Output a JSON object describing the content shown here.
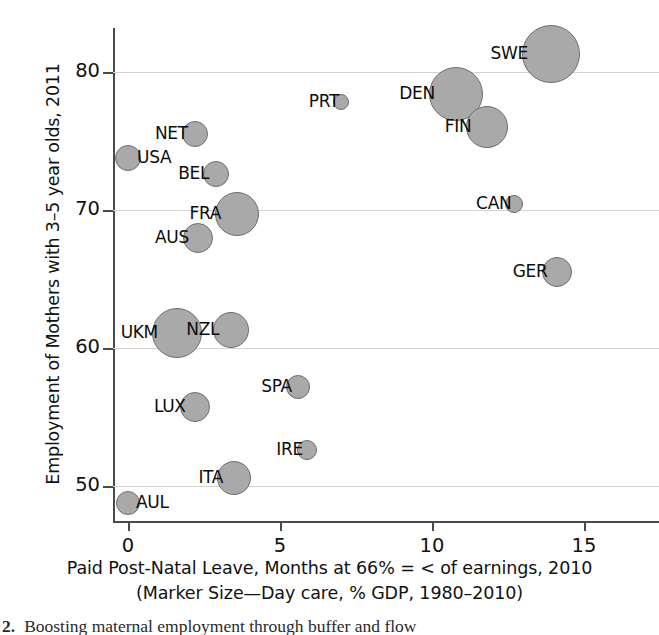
{
  "chart_data": {
    "type": "scatter",
    "title": "",
    "xlabel": "Paid Post-Natal Leave, Months at 66% = < of earnings, 2010",
    "xlabel_line2": "(Marker Size—Day care, % GDP, 1980–2010)",
    "ylabel": "Employment of Mothers with 3–5 year olds, 2011",
    "xlim": [
      -0.8,
      15.8
    ],
    "ylim": [
      47.8,
      83.5
    ],
    "xticks": [
      0,
      5,
      10,
      15
    ],
    "xticklabels": [
      "0",
      "5",
      "10",
      "15"
    ],
    "yticks": [
      50,
      60,
      70,
      80
    ],
    "yticklabels": [
      "50",
      "60",
      "70",
      "80"
    ],
    "grid": "horizontal",
    "legend": "none",
    "size_encoding": "Day care, % GDP, 1980–2010",
    "marker_color": "#a9a9a9",
    "marker_edge_color": "#6e6e6e",
    "points": [
      {
        "label": "SWE",
        "x": 13.9,
        "y": 81.3,
        "r": 29,
        "label_side": "left"
      },
      {
        "label": "DEN",
        "x": 10.8,
        "y": 78.4,
        "r": 27,
        "label_side": "left"
      },
      {
        "label": "FIN",
        "x": 11.8,
        "y": 76.0,
        "r": 21,
        "label_side": "left"
      },
      {
        "label": "PRT",
        "x": 7.0,
        "y": 77.8,
        "r": 8,
        "label_side": "left"
      },
      {
        "label": "NET",
        "x": 2.2,
        "y": 75.5,
        "r": 13,
        "label_side": "left"
      },
      {
        "label": "USA",
        "x": 0.0,
        "y": 73.8,
        "r": 13,
        "label_side": "right"
      },
      {
        "label": "BEL",
        "x": 2.9,
        "y": 72.6,
        "r": 13,
        "label_side": "left"
      },
      {
        "label": "CAN",
        "x": 12.7,
        "y": 70.4,
        "r": 9,
        "label_side": "left"
      },
      {
        "label": "FRA",
        "x": 3.6,
        "y": 69.7,
        "r": 22,
        "label_side": "left"
      },
      {
        "label": "AUS",
        "x": 2.3,
        "y": 68.0,
        "r": 15,
        "label_side": "left"
      },
      {
        "label": "GER",
        "x": 14.1,
        "y": 65.5,
        "r": 15,
        "label_side": "left"
      },
      {
        "label": "UKM",
        "x": 1.6,
        "y": 61.1,
        "r": 25,
        "label_side": "left"
      },
      {
        "label": "NZL",
        "x": 3.4,
        "y": 61.3,
        "r": 18,
        "label_side": "left"
      },
      {
        "label": "SPA",
        "x": 5.6,
        "y": 57.2,
        "r": 12,
        "label_side": "left"
      },
      {
        "label": "LUX",
        "x": 2.2,
        "y": 55.7,
        "r": 15,
        "label_side": "left"
      },
      {
        "label": "IRE",
        "x": 5.9,
        "y": 52.6,
        "r": 10,
        "label_side": "left"
      },
      {
        "label": "ITA",
        "x": 3.5,
        "y": 50.6,
        "r": 17,
        "label_side": "left"
      },
      {
        "label": "AUL",
        "x": 0.0,
        "y": 48.8,
        "r": 12,
        "label_side": "right"
      }
    ]
  },
  "caption": {
    "number": "2.",
    "text": "Boosting maternal employment through buffer and flow"
  }
}
